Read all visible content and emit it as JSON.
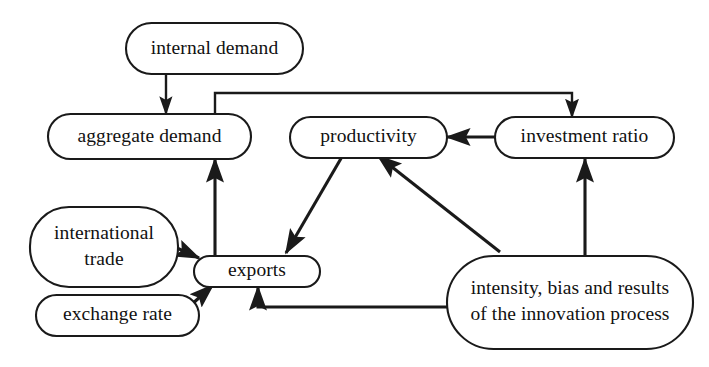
{
  "diagram": {
    "title": "",
    "background_color": "#ffffff",
    "stroke_color": "#1a1a1a",
    "text_color": "#111111",
    "nodes": [
      {
        "id": "internal_demand",
        "label": "internal demand",
        "label_line1": "internal demand",
        "label_line2": ""
      },
      {
        "id": "aggregate_demand",
        "label": "aggregate demand",
        "label_line1": "aggregate demand",
        "label_line2": ""
      },
      {
        "id": "productivity",
        "label": "productivity",
        "label_line1": "productivity",
        "label_line2": ""
      },
      {
        "id": "investment_ratio",
        "label": "investment ratio",
        "label_line1": "investment ratio",
        "label_line2": ""
      },
      {
        "id": "international_trade",
        "label": "international trade",
        "label_line1": "international",
        "label_line2": "trade"
      },
      {
        "id": "exchange_rate",
        "label": "exchange rate",
        "label_line1": "exchange rate",
        "label_line2": ""
      },
      {
        "id": "exports",
        "label": "exports",
        "label_line1": "exports",
        "label_line2": ""
      },
      {
        "id": "innovation",
        "label": "intensity, bias and results of the innovation process",
        "label_line1": "intensity, bias and results",
        "label_line2": "of the innovation process"
      }
    ],
    "edges": [
      {
        "id": "e1",
        "from": "internal demand",
        "to": "aggregate demand",
        "style": "straight-vertical"
      },
      {
        "id": "e2",
        "from": "aggregate demand",
        "to": "investment ratio",
        "style": "orthogonal-over-top"
      },
      {
        "id": "e3",
        "from": "investment ratio",
        "to": "productivity",
        "style": "straight-horizontal"
      },
      {
        "id": "e4",
        "from": "productivity",
        "to": "exports",
        "style": "diagonal"
      },
      {
        "id": "e5",
        "from": "innovation",
        "to": "productivity",
        "style": "diagonal"
      },
      {
        "id": "e6",
        "from": "innovation",
        "to": "investment ratio",
        "style": "straight-vertical"
      },
      {
        "id": "e7",
        "from": "innovation",
        "to": "exports",
        "style": "orthogonal-under-bottom"
      },
      {
        "id": "e8",
        "from": "international trade",
        "to": "exports",
        "style": "diagonal"
      },
      {
        "id": "e9",
        "from": "exchange rate",
        "to": "exports",
        "style": "diagonal"
      },
      {
        "id": "e10",
        "from": "exports",
        "to": "aggregate demand",
        "style": "straight-vertical"
      }
    ]
  }
}
